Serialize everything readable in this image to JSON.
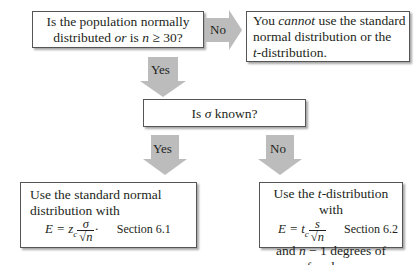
{
  "diagram": {
    "colors": {
      "arrow_fill": "#bcbcbc",
      "box_border": "#555555",
      "text": "#231f20"
    },
    "nodes": {
      "q1": {
        "line1": "Is the population normally",
        "line2_a": "distributed ",
        "line2_or": "or",
        "line2_b": " is ",
        "line2_n": "n",
        "line2_c": " ≥ 30?"
      },
      "cannot": {
        "line1_a": "You ",
        "line1_em": "cannot",
        "line1_b": " use the standard",
        "line2": "normal distribution or the",
        "line3_t": "t",
        "line3_b": "-distribution."
      },
      "q2": {
        "a": "Is ",
        "sigma": "σ",
        "b": " known?"
      },
      "normal": {
        "line1": "Use the standard normal",
        "line2": "distribution with",
        "eq_lhs": "E = z",
        "eq_sub": "c",
        "num": "σ",
        "den": "√n",
        "dot": "·",
        "section": "Section 6.1"
      },
      "tdist": {
        "line1_a": "Use the ",
        "line1_t": "t",
        "line1_b": "-distribution with",
        "eq_lhs": "E = t",
        "eq_sub": "c",
        "num": "s",
        "den": "√n",
        "section": "Section 6.2",
        "line3_a": "and ",
        "line3_n": "n",
        "line3_b": " − 1 degrees of freedom."
      }
    },
    "edges": {
      "q1_no": "No",
      "q1_yes": "Yes",
      "q2_yes": "Yes",
      "q2_no": "No"
    }
  }
}
